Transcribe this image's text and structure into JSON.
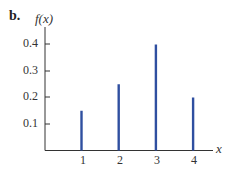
{
  "figure_label": "b.",
  "colors": {
    "bar": "#2f4fa0",
    "axis": "#333333"
  },
  "chart_data": {
    "type": "bar",
    "subtype": "stem / probability mass function",
    "title": "",
    "xlabel": "x",
    "ylabel": "f(x)",
    "categories": [
      "1",
      "2",
      "3",
      "4"
    ],
    "x": [
      1,
      2,
      3,
      4
    ],
    "values": [
      0.15,
      0.25,
      0.4,
      0.2
    ],
    "yticks": [
      "0.1",
      "0.2",
      "0.3",
      "0.4"
    ],
    "xticks": [
      "1",
      "2",
      "3",
      "4"
    ],
    "ylim": [
      0,
      0.45
    ],
    "xlim": [
      0,
      4.5
    ],
    "grid": false,
    "legend": null
  }
}
